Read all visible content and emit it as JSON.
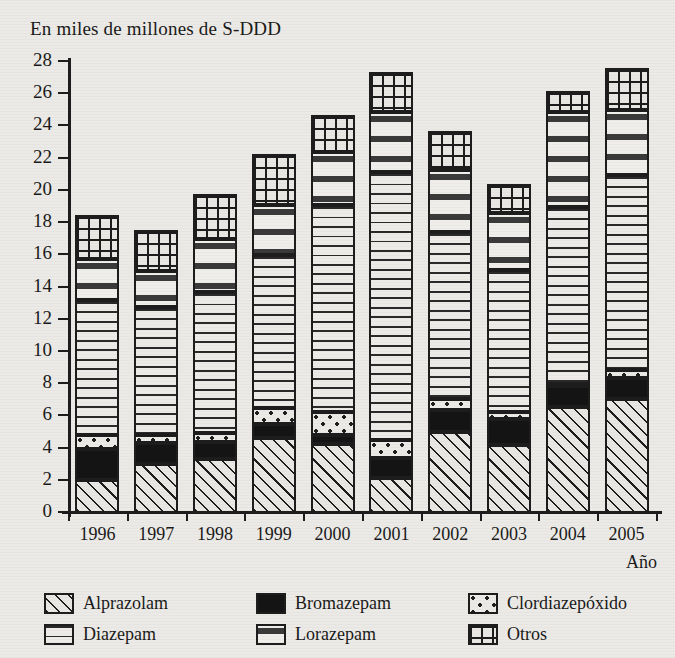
{
  "chart_data": {
    "type": "bar",
    "stacked": true,
    "title": "En miles de millones de S-DDD",
    "xlabel": "Año",
    "ylabel": "",
    "ylim": [
      0,
      28
    ],
    "ytick_step": 2,
    "yticks": [
      0,
      2,
      4,
      6,
      8,
      10,
      12,
      14,
      16,
      18,
      20,
      22,
      24,
      26,
      28
    ],
    "grid": false,
    "legend_position": "bottom",
    "categories": [
      "1996",
      "1997",
      "1998",
      "1999",
      "2000",
      "2001",
      "2002",
      "2003",
      "2004",
      "2005"
    ],
    "series": [
      {
        "name": "Alprazolam",
        "pattern": "diagonal-hatch",
        "values": [
          2.05,
          3.05,
          3.35,
          4.65,
          4.3,
          2.2,
          5.05,
          4.25,
          6.6,
          7.1
        ]
      },
      {
        "name": "Bromazepam",
        "pattern": "solid-black",
        "values": [
          1.9,
          1.3,
          1.05,
          0.85,
          0.55,
          1.2,
          1.35,
          1.6,
          1.3,
          1.3
        ]
      },
      {
        "name": "Clordiazepóxido",
        "pattern": "dots",
        "values": [
          0.9,
          0.5,
          0.55,
          1.0,
          1.45,
          1.15,
          0.65,
          0.45,
          0.1,
          0.5
        ]
      },
      {
        "name": "Diazepam",
        "pattern": "horizontal-lines",
        "values": [
          8.4,
          7.95,
          8.75,
          9.5,
          12.8,
          16.65,
          10.4,
          8.8,
          11.0,
          12.1
        ]
      },
      {
        "name": "Lorazepam",
        "pattern": "sparse-vertical-ticks",
        "values": [
          2.5,
          2.2,
          3.3,
          3.1,
          3.3,
          3.7,
          3.85,
          3.5,
          5.9,
          4.0
        ]
      },
      {
        "name": "Otros",
        "pattern": "grid",
        "values": [
          2.75,
          2.6,
          2.8,
          3.2,
          2.3,
          2.5,
          2.4,
          1.8,
          1.3,
          2.6
        ]
      }
    ],
    "totals": [
      18.5,
      17.6,
      19.8,
      22.3,
      24.7,
      27.4,
      23.7,
      20.4,
      26.2,
      27.6
    ]
  },
  "legend": {
    "items": [
      {
        "label": "Alprazolam",
        "swatch": "diagonal-hatch-swatch"
      },
      {
        "label": "Bromazepam",
        "swatch": "solid-black-swatch"
      },
      {
        "label": "Clordiazepóxido",
        "swatch": "dots-swatch"
      },
      {
        "label": "Diazepam",
        "swatch": "horizontal-lines-swatch"
      },
      {
        "label": "Lorazepam",
        "swatch": "sparse-vertical-ticks-swatch"
      },
      {
        "label": "Otros",
        "swatch": "grid-swatch"
      }
    ]
  },
  "colors": {
    "ink": "#1d1d1d",
    "paper": "#eceae6",
    "fill_light": "#e9e7e3",
    "fill_black": "#141414"
  }
}
